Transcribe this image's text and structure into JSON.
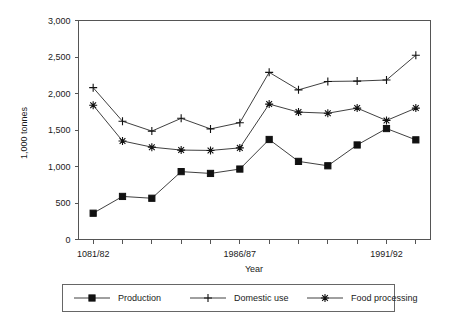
{
  "chart_data": {
    "type": "line",
    "title": "",
    "xlabel": "Year",
    "ylabel": "1,000 tonnes",
    "categories": [
      "1081/82",
      "",
      "",
      "",
      "",
      "1986/87",
      "",
      "",
      "",
      "",
      "1991/92",
      ""
    ],
    "x_tick_labels": [
      "1081/82",
      "1986/87",
      "1991/92"
    ],
    "x_tick_label_indices": [
      0,
      5,
      10
    ],
    "x_points": 12,
    "y_tick_labels": [
      "0",
      "500",
      "1,000",
      "1,500",
      "2,000",
      "2,500",
      "3,000"
    ],
    "y_tick_values": [
      0,
      500,
      1000,
      1500,
      2000,
      2500,
      3000
    ],
    "ylim": [
      0,
      3000
    ],
    "grid": false,
    "legend_position": "bottom",
    "series": [
      {
        "name": "Production",
        "marker": "square",
        "values": [
          360,
          590,
          565,
          930,
          905,
          965,
          1370,
          1070,
          1010,
          1295,
          1520,
          1365
        ]
      },
      {
        "name": "Domestic use",
        "marker": "plus",
        "values": [
          2080,
          1620,
          1485,
          1660,
          1515,
          1600,
          2290,
          2050,
          2165,
          2170,
          2185,
          2525
        ]
      },
      {
        "name": "Food processing",
        "marker": "asterisk",
        "values": [
          1840,
          1350,
          1265,
          1225,
          1220,
          1255,
          1855,
          1745,
          1730,
          1800,
          1630,
          1800
        ]
      }
    ]
  },
  "legend": {
    "items": [
      {
        "label": "Production",
        "marker": "square"
      },
      {
        "label": "Domestic use",
        "marker": "plus"
      },
      {
        "label": "Food processing",
        "marker": "asterisk"
      }
    ]
  },
  "colors": {
    "line": "#2a2a2a",
    "marker": "#111111",
    "axis": "#555555",
    "text": "#1a1a1a",
    "background": "#ffffff"
  }
}
